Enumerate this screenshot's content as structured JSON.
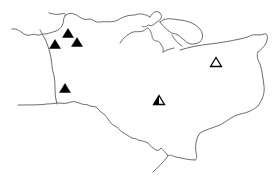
{
  "map": {
    "width": 277,
    "height": 181,
    "colors": {
      "background": "#ffffff",
      "boundary": "#5a5a5a",
      "marker": "#000000"
    },
    "markers": [
      {
        "id": "m1",
        "type": "filled",
        "x": 68,
        "y": 33
      },
      {
        "id": "m2",
        "type": "filled",
        "x": 77,
        "y": 42
      },
      {
        "id": "m3",
        "type": "filled",
        "x": 55,
        "y": 44
      },
      {
        "id": "m4",
        "type": "filled",
        "x": 65,
        "y": 88
      },
      {
        "id": "m5",
        "type": "hollow",
        "x": 216,
        "y": 62
      },
      {
        "id": "m6",
        "type": "half-filled",
        "x": 159,
        "y": 100
      }
    ]
  }
}
